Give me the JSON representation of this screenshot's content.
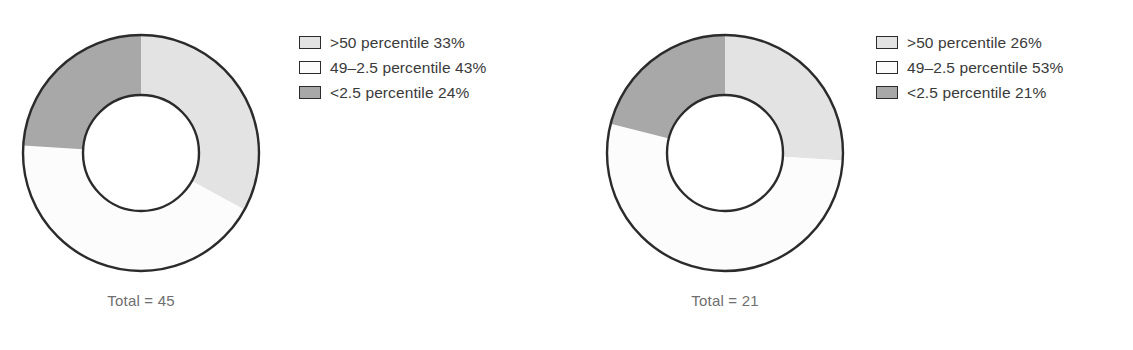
{
  "colors": {
    "above50": "#e3e3e3",
    "mid": "#fcfcfc",
    "below25": "#a8a8a8",
    "stroke": "#2b2b2b",
    "text": "#3a3a3a",
    "total_text": "#6f6f6f",
    "background": "#ffffff"
  },
  "chart_data": [
    {
      "type": "pie",
      "variant": "donut",
      "title": "",
      "total_label": "Total = 45",
      "total": 45,
      "legend_position": "right",
      "start_angle_deg": 0,
      "direction": "clockwise",
      "categories": [
        ">50 percentile",
        "49–2.5 percentile",
        "<2.5 percentile"
      ],
      "values": [
        33,
        43,
        24
      ],
      "unit": "%",
      "slices": [
        {
          "label": ">50 percentile",
          "value": 33,
          "display": ">50 percentile 33%",
          "color": "#e3e3e3"
        },
        {
          "label": "49–2.5 percentile",
          "value": 43,
          "display": "49–2.5 percentile 43%",
          "color": "#fcfcfc"
        },
        {
          "label": "<2.5 percentile",
          "value": 24,
          "display": "<2.5 percentile 24%",
          "color": "#a8a8a8"
        }
      ]
    },
    {
      "type": "pie",
      "variant": "donut",
      "title": "",
      "total_label": "Total = 21",
      "total": 21,
      "legend_position": "right",
      "start_angle_deg": 0,
      "direction": "clockwise",
      "categories": [
        ">50 percentile",
        "49–2.5 percentile",
        "<2.5 percentile"
      ],
      "values": [
        26,
        53,
        21
      ],
      "unit": "%",
      "slices": [
        {
          "label": ">50 percentile",
          "value": 26,
          "display": ">50 percentile 26%",
          "color": "#e3e3e3"
        },
        {
          "label": "49–2.5 percentile",
          "value": 53,
          "display": "49–2.5 percentile 53%",
          "color": "#fcfcfc"
        },
        {
          "label": "<2.5 percentile",
          "value": 21,
          "display": "<2.5 percentile 21%",
          "color": "#a8a8a8"
        }
      ]
    }
  ]
}
